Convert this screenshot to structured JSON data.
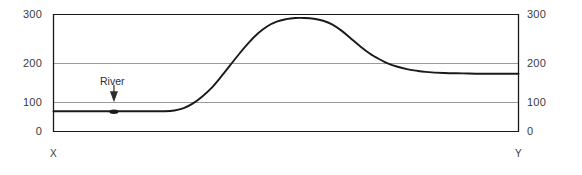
{
  "chart_data": {
    "type": "line",
    "title": "",
    "subtitle": "",
    "xlabel": "",
    "ylabel": "",
    "xlim": [
      0,
      100
    ],
    "ylim": [
      0,
      300
    ],
    "grid": true,
    "legend": null,
    "y_ticks": [
      0,
      100,
      200,
      300
    ],
    "y_tick_labels_left": [
      "0",
      "100",
      "200",
      "300"
    ],
    "y_tick_labels_right": [
      "0",
      "100",
      "200",
      "300"
    ],
    "x_endpoints": {
      "start_label": "X",
      "end_label": "Y"
    },
    "series": [
      {
        "name": "terrain-profile",
        "color": "#1a1a1a",
        "x": [
          0,
          4,
          8,
          12,
          16,
          20,
          24,
          26,
          28,
          30,
          32,
          34,
          36,
          38,
          40,
          42,
          44,
          46,
          48,
          50,
          52,
          54,
          56,
          58,
          60,
          62,
          64,
          66,
          68,
          70,
          72,
          74,
          76,
          78,
          80,
          84,
          88,
          92,
          96,
          100
        ],
        "values": [
          52,
          52,
          52,
          52,
          52,
          52,
          52,
          54,
          60,
          72,
          90,
          112,
          140,
          170,
          200,
          228,
          252,
          270,
          282,
          288,
          291,
          291,
          289,
          284,
          274,
          258,
          238,
          218,
          200,
          186,
          174,
          166,
          160,
          156,
          153,
          150,
          149,
          148,
          148,
          148
        ]
      }
    ],
    "annotations": [
      {
        "name": "river",
        "text": "River",
        "x": 13,
        "y_text": 130,
        "y_point": 52,
        "arrow": "down"
      }
    ]
  },
  "axes": {
    "frame_color": "#1a1a1a",
    "grid_color": "#9a9a9a",
    "curve_color": "#1a1a1a"
  }
}
